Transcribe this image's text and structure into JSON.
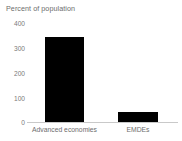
{
  "chart_data": {
    "type": "bar",
    "title": "Percent of population",
    "xlabel": "",
    "ylabel": "",
    "categories": [
      "Advanced economies",
      "EMDEs"
    ],
    "values": [
      342,
      42
    ],
    "ylim": [
      0,
      400
    ],
    "yticks": [
      400,
      300,
      200,
      100,
      0
    ],
    "ytick_labels": [
      "400",
      "300",
      "200",
      "100",
      "0"
    ],
    "grid": false,
    "legend": null,
    "bar_color": "#000000",
    "text_color": "#6d6d6d",
    "axis_color": "#c9c9c9",
    "background": "#ffffff"
  }
}
